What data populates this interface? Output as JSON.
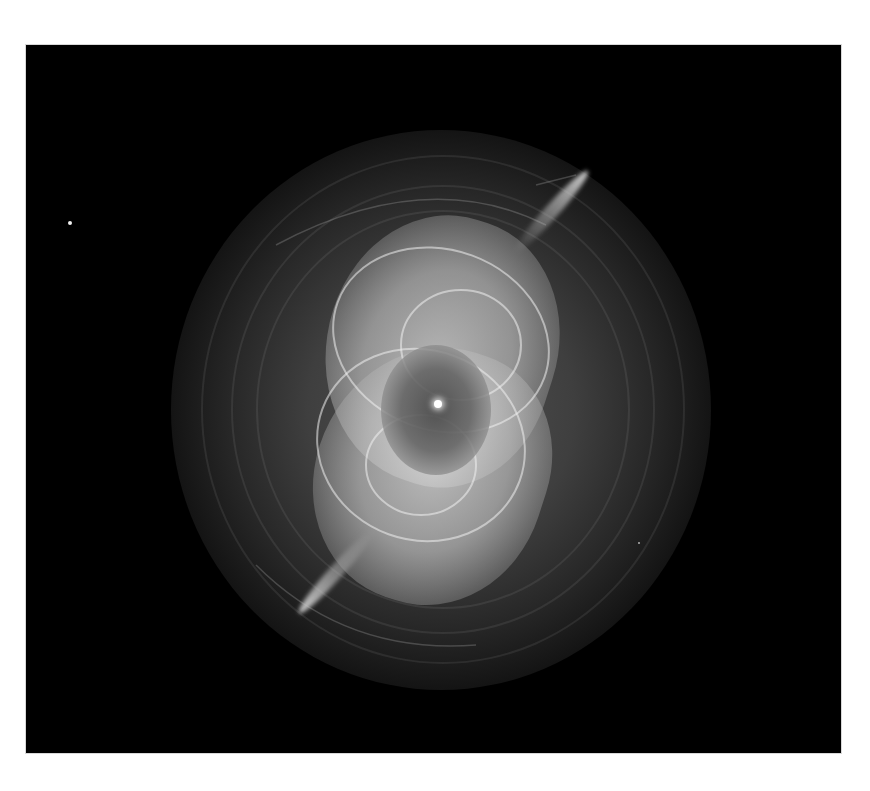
{
  "image": {
    "subject": "Cat's Eye Nebula",
    "alt": "Grayscale telescope image of a planetary nebula with bright intertwined inner shells, a central star, two opposite jets and concentric outer halo rings on a black background",
    "palette": {
      "background": "#ffffff",
      "space": "#000000",
      "nebula_bright": "#e6e6e6",
      "nebula_mid": "#9a9a9a",
      "star": "#ffffff"
    },
    "frame": {
      "left": 26,
      "top": 45,
      "width": 815,
      "height": 708
    },
    "features": {
      "central_star": {
        "x": 438,
        "y": 404
      },
      "field_stars": [
        {
          "x": 70,
          "y": 223,
          "size": 4
        },
        {
          "x": 639,
          "y": 543,
          "size": 2
        }
      ],
      "jets": [
        "north-east",
        "south-west"
      ]
    }
  }
}
